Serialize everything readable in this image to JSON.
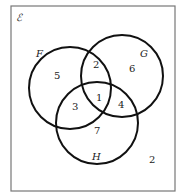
{
  "diagram": {
    "type": "venn",
    "universal_set": {
      "label": "ℰ",
      "x": 11,
      "y": 6,
      "w": 164,
      "h": 185
    },
    "sets": [
      {
        "name": "F",
        "cx": 70,
        "cy": 88,
        "r": 41,
        "label_x": 36,
        "label_y": 57
      },
      {
        "name": "G",
        "cx": 122,
        "cy": 76,
        "r": 41,
        "label_x": 140,
        "label_y": 57
      },
      {
        "name": "H",
        "cx": 97,
        "cy": 123,
        "r": 41,
        "label_x": 92,
        "label_y": 160
      }
    ],
    "regions": [
      {
        "id": "F_only",
        "value": "5",
        "x": 54,
        "y": 79
      },
      {
        "id": "F_and_G_only",
        "value": "2",
        "x": 93,
        "y": 68
      },
      {
        "id": "G_only",
        "value": "6",
        "x": 129,
        "y": 72
      },
      {
        "id": "F_and_H_only",
        "value": "3",
        "x": 72,
        "y": 110
      },
      {
        "id": "F_G_H",
        "value": "1",
        "x": 96,
        "y": 101
      },
      {
        "id": "G_and_H_only",
        "value": "4",
        "x": 118,
        "y": 108
      },
      {
        "id": "H_only",
        "value": "7",
        "x": 94,
        "y": 134
      },
      {
        "id": "outside",
        "value": "2",
        "x": 149,
        "y": 163
      }
    ]
  }
}
